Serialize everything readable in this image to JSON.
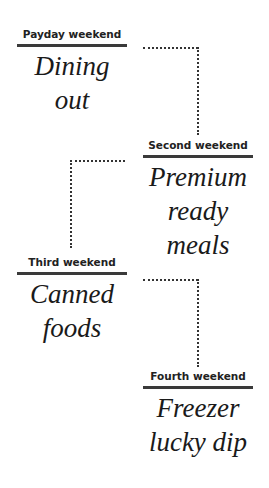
{
  "steps": [
    {
      "label": "Payday weekend",
      "title_lines": [
        "Dining out"
      ]
    },
    {
      "label": "Second weekend",
      "title_lines": [
        "Premium",
        "ready meals"
      ]
    },
    {
      "label": "Third weekend",
      "title_lines": [
        "Canned",
        "foods"
      ]
    },
    {
      "label": "Fourth weekend",
      "title_lines": [
        "Freezer",
        "lucky dip"
      ]
    }
  ],
  "colors": {
    "rule": "#3a3a3a",
    "text": "#1a1a1a",
    "dots": "#333333"
  }
}
